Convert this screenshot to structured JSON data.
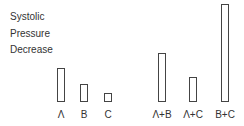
{
  "chart_data": {
    "type": "bar",
    "title": "",
    "ylabel": "Systolic Pressure Decrease",
    "ylabel_lines": [
      "Systolic",
      "Pressure",
      "Decrease"
    ],
    "xlabel": "",
    "categories": [
      "Λ",
      "B",
      "C",
      "Λ+B",
      "Λ+C",
      "B+C"
    ],
    "values": [
      34,
      18,
      9,
      49,
      25,
      98
    ],
    "units": "relative (pixel height, no axis scale shown)",
    "grid": false,
    "legend": null,
    "style": "outlined bars, no axis lines"
  },
  "layout": {
    "baseline": 102,
    "bars": [
      {
        "label": "Λ",
        "left": 57,
        "width": 8,
        "height": 34
      },
      {
        "label": "B",
        "left": 80,
        "width": 8,
        "height": 18
      },
      {
        "label": "C",
        "left": 104,
        "width": 8,
        "height": 9
      },
      {
        "label": "Λ+B",
        "left": 158,
        "width": 8,
        "height": 49
      },
      {
        "label": "Λ+C",
        "left": 189,
        "width": 8,
        "height": 25
      },
      {
        "label": "B+C",
        "left": 221,
        "width": 8,
        "height": 98
      }
    ]
  }
}
